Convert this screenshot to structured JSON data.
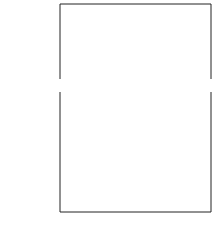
{
  "chart_data": [
    {
      "type": "scatter",
      "panel": "top",
      "title": "",
      "annotation": "α = 0.20",
      "xlabel": "",
      "ylabel": "",
      "xlim": [
        1,
        25
      ],
      "ylim": [
        0.78,
        1.0
      ],
      "yticks": [
        "1.0",
        "0.9",
        "0.8"
      ],
      "grid": false,
      "series": [
        {
          "name": "circles-upper (decreasing from 1.0)",
          "style": "open-circle",
          "x": [
            1,
            2,
            3,
            4,
            5,
            6,
            7,
            8,
            9,
            10,
            11,
            12,
            13,
            14,
            15,
            16,
            17,
            18,
            19,
            20,
            21,
            22,
            23,
            24
          ],
          "values": [
            1.0,
            0.99,
            0.975,
            0.97,
            0.968,
            0.968,
            0.968,
            0.968,
            0.967,
            0.967,
            0.967,
            0.967,
            0.967,
            0.967,
            0.967,
            0.967,
            0.967,
            0.967,
            0.967,
            0.967,
            0.967,
            0.967,
            0.967,
            0.967
          ]
        },
        {
          "name": "circles-lower (increasing from 0.8)",
          "style": "open-circle",
          "x": [
            1,
            2,
            3,
            4,
            5
          ],
          "values": [
            0.8,
            0.93,
            0.955,
            0.963,
            0.966
          ]
        },
        {
          "name": "theory-upper",
          "style": "line",
          "x": [
            1,
            2,
            3,
            4,
            5,
            8,
            12,
            16,
            20,
            24
          ],
          "values": [
            1.0,
            0.985,
            0.974,
            0.97,
            0.968,
            0.967,
            0.967,
            0.967,
            0.967,
            0.967
          ]
        },
        {
          "name": "theory-lower",
          "style": "line",
          "x": [
            1,
            1.3,
            2,
            3,
            4,
            5,
            8,
            12,
            16,
            20,
            24
          ],
          "values": [
            0.82,
            0.89,
            0.93,
            0.955,
            0.963,
            0.966,
            0.967,
            0.967,
            0.967,
            0.967,
            0.967
          ]
        }
      ]
    },
    {
      "type": "scatter",
      "panel": "bottom",
      "title": "",
      "xlabel": "l",
      "ylabel": "m(l)",
      "xlim": [
        1,
        25
      ],
      "ylim": [
        0.0,
        0.37
      ],
      "xticks": [
        "5",
        "10",
        "15",
        "20",
        "25"
      ],
      "yticks": [
        "0.0",
        "0.1",
        "0.2",
        "0.3"
      ],
      "grid": false,
      "series": [
        {
          "name": "simulation",
          "style": "open-circle",
          "x": [
            1,
            2,
            3,
            4,
            5,
            6,
            7,
            8,
            9,
            10,
            11,
            12,
            13,
            14,
            15,
            16,
            17,
            18,
            19,
            20,
            21,
            22,
            23,
            24
          ],
          "values": [
            0.2,
            0.355,
            0.325,
            0.3,
            0.265,
            0.235,
            0.215,
            0.19,
            0.17,
            0.155,
            0.132,
            0.122,
            0.108,
            0.098,
            0.085,
            0.08,
            0.077,
            0.072,
            0.068,
            0.055,
            0.05,
            0.05,
            0.04,
            0.043
          ]
        },
        {
          "name": "theory",
          "style": "line",
          "x": [
            1,
            1.5,
            2,
            3,
            4,
            5,
            6,
            7,
            8,
            9,
            10,
            11,
            12,
            13,
            14,
            15,
            16,
            17,
            18,
            19,
            20,
            21,
            22,
            23,
            24
          ],
          "values": [
            0.2,
            0.3,
            0.345,
            0.32,
            0.29,
            0.262,
            0.238,
            0.215,
            0.194,
            0.175,
            0.157,
            0.141,
            0.127,
            0.114,
            0.102,
            0.09,
            0.08,
            0.071,
            0.063,
            0.055,
            0.048,
            0.042,
            0.036,
            0.03,
            0.022
          ]
        }
      ]
    }
  ],
  "labels": {
    "top_yticks": [
      "1.0",
      "0.9",
      "0.8"
    ],
    "bottom_yticks": [
      "0.3",
      "0.2",
      "0.1",
      "0.0"
    ],
    "bottom_xticks": [
      "5",
      "10",
      "15",
      "20",
      "25"
    ],
    "alpha_annotation": "α = 0.20",
    "ylabel_main": "m",
    "ylabel_sup": "(l)",
    "xlabel": "l"
  }
}
